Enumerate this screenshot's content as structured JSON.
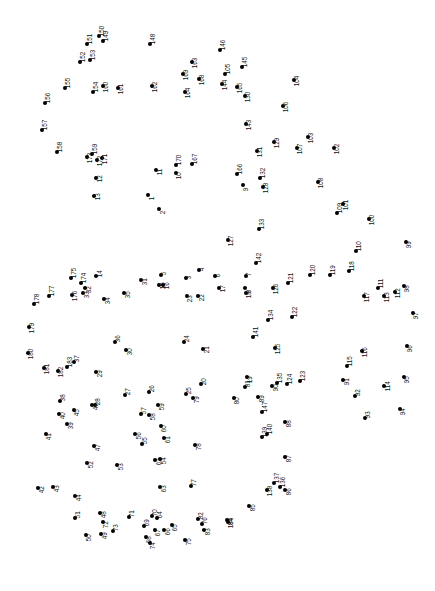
{
  "page": {
    "type": "connect-the-dots-puzzle",
    "width": 435,
    "height": 591,
    "background_color": "#ffffff",
    "dot_color": "#000000",
    "label_color": "#111111",
    "label_rotation_deg": -90,
    "dot_count": 184
  },
  "chart_data": {
    "type": "scatter",
    "xlabel": "",
    "ylabel": "",
    "xlim": [
      0,
      435
    ],
    "ylim": [
      0,
      591
    ],
    "grid": false,
    "legend": "none",
    "points": [
      {
        "n": "1",
        "x": 148,
        "y": 195,
        "lx": 4,
        "ly": 2
      },
      {
        "n": "2",
        "x": 159,
        "y": 209,
        "lx": 4,
        "ly": 2
      },
      {
        "n": "3",
        "x": 186,
        "y": 278,
        "lx": 3,
        "ly": -2
      },
      {
        "n": "4",
        "x": 199,
        "y": 270,
        "lx": 3,
        "ly": -2
      },
      {
        "n": "5",
        "x": 161,
        "y": 275,
        "lx": 3,
        "ly": -3
      },
      {
        "n": "6",
        "x": 215,
        "y": 276,
        "lx": 3,
        "ly": -2
      },
      {
        "n": "7",
        "x": 246,
        "y": 276,
        "lx": 3,
        "ly": -3
      },
      {
        "n": "8",
        "x": 245,
        "y": 288,
        "lx": 4,
        "ly": 2
      },
      {
        "n": "9",
        "x": 243,
        "y": 185,
        "lx": 3,
        "ly": 3
      },
      {
        "n": "10",
        "x": 176,
        "y": 173,
        "lx": 3,
        "ly": 3
      },
      {
        "n": "11",
        "x": 156,
        "y": 170,
        "lx": 4,
        "ly": 2
      },
      {
        "n": "12",
        "x": 96,
        "y": 178,
        "lx": 4,
        "ly": 1
      },
      {
        "n": "13",
        "x": 94,
        "y": 196,
        "lx": 4,
        "ly": 1
      },
      {
        "n": "14",
        "x": 96,
        "y": 276,
        "lx": 4,
        "ly": -2
      },
      {
        "n": "15",
        "x": 159,
        "y": 285,
        "lx": 4,
        "ly": 1
      },
      {
        "n": "16",
        "x": 163,
        "y": 285,
        "lx": 4,
        "ly": 1
      },
      {
        "n": "17",
        "x": 219,
        "y": 288,
        "lx": 4,
        "ly": 1
      },
      {
        "n": "18",
        "x": 246,
        "y": 293,
        "lx": 3,
        "ly": 2
      },
      {
        "n": "19",
        "x": 247,
        "y": 377,
        "lx": 3,
        "ly": 3
      },
      {
        "n": "20",
        "x": 201,
        "y": 384,
        "lx": 3,
        "ly": -2
      },
      {
        "n": "21",
        "x": 203,
        "y": 349,
        "lx": 4,
        "ly": 1
      },
      {
        "n": "22",
        "x": 198,
        "y": 296,
        "lx": 4,
        "ly": 2
      },
      {
        "n": "23",
        "x": 187,
        "y": 296,
        "lx": 3,
        "ly": 3
      },
      {
        "n": "24",
        "x": 184,
        "y": 342,
        "lx": 3,
        "ly": -3
      },
      {
        "n": "25",
        "x": 186,
        "y": 394,
        "lx": 3,
        "ly": -3
      },
      {
        "n": "26",
        "x": 149,
        "y": 392,
        "lx": 3,
        "ly": -3
      },
      {
        "n": "27",
        "x": 125,
        "y": 395,
        "lx": 3,
        "ly": -3
      },
      {
        "n": "28",
        "x": 95,
        "y": 405,
        "lx": 3,
        "ly": -3
      },
      {
        "n": "29",
        "x": 96,
        "y": 372,
        "lx": 4,
        "ly": 2
      },
      {
        "n": "30",
        "x": 126,
        "y": 350,
        "lx": 4,
        "ly": 2
      },
      {
        "n": "31",
        "x": 141,
        "y": 280,
        "lx": 4,
        "ly": 2
      },
      {
        "n": "32",
        "x": 85,
        "y": 288,
        "lx": 4,
        "ly": 2
      },
      {
        "n": "33",
        "x": 83,
        "y": 293,
        "lx": 4,
        "ly": 2
      },
      {
        "n": "34",
        "x": 104,
        "y": 299,
        "lx": 4,
        "ly": 2
      },
      {
        "n": "35",
        "x": 124,
        "y": 293,
        "lx": 4,
        "ly": 2
      },
      {
        "n": "36",
        "x": 115,
        "y": 342,
        "lx": 3,
        "ly": -3
      },
      {
        "n": "37",
        "x": 74,
        "y": 362,
        "lx": 3,
        "ly": -3
      },
      {
        "n": "38",
        "x": 60,
        "y": 401,
        "lx": 3,
        "ly": -3
      },
      {
        "n": "39",
        "x": 67,
        "y": 424,
        "lx": 4,
        "ly": 2
      },
      {
        "n": "40",
        "x": 59,
        "y": 414,
        "lx": 4,
        "ly": 2
      },
      {
        "n": "41",
        "x": 46,
        "y": 434,
        "lx": 3,
        "ly": 3
      },
      {
        "n": "42",
        "x": 38,
        "y": 488,
        "lx": 4,
        "ly": 2
      },
      {
        "n": "43",
        "x": 53,
        "y": 487,
        "lx": 4,
        "ly": 2
      },
      {
        "n": "44",
        "x": 75,
        "y": 496,
        "lx": 4,
        "ly": 2
      },
      {
        "n": "45",
        "x": 74,
        "y": 410,
        "lx": 3,
        "ly": 3
      },
      {
        "n": "46",
        "x": 92,
        "y": 405,
        "lx": 4,
        "ly": 2
      },
      {
        "n": "47",
        "x": 94,
        "y": 446,
        "lx": 4,
        "ly": 2
      },
      {
        "n": "48",
        "x": 100,
        "y": 513,
        "lx": 4,
        "ly": 2
      },
      {
        "n": "49",
        "x": 101,
        "y": 534,
        "lx": 4,
        "ly": 2
      },
      {
        "n": "50",
        "x": 86,
        "y": 535,
        "lx": 3,
        "ly": 3
      },
      {
        "n": "51",
        "x": 75,
        "y": 518,
        "lx": 3,
        "ly": -3
      },
      {
        "n": "52",
        "x": 87,
        "y": 463,
        "lx": 4,
        "ly": 2
      },
      {
        "n": "53",
        "x": 117,
        "y": 465,
        "lx": 4,
        "ly": 2
      },
      {
        "n": "54",
        "x": 160,
        "y": 459,
        "lx": 4,
        "ly": 2
      },
      {
        "n": "55",
        "x": 142,
        "y": 444,
        "lx": 3,
        "ly": -3
      },
      {
        "n": "56",
        "x": 135,
        "y": 434,
        "lx": 4,
        "ly": 2
      },
      {
        "n": "57",
        "x": 141,
        "y": 414,
        "lx": 3,
        "ly": -3
      },
      {
        "n": "58",
        "x": 149,
        "y": 415,
        "lx": 4,
        "ly": 2
      },
      {
        "n": "59",
        "x": 158,
        "y": 405,
        "lx": 4,
        "ly": 2
      },
      {
        "n": "60",
        "x": 161,
        "y": 426,
        "lx": 3,
        "ly": 3
      },
      {
        "n": "61",
        "x": 164,
        "y": 438,
        "lx": 4,
        "ly": 2
      },
      {
        "n": "62",
        "x": 155,
        "y": 460,
        "lx": 4,
        "ly": 2
      },
      {
        "n": "63",
        "x": 160,
        "y": 487,
        "lx": 4,
        "ly": 2
      },
      {
        "n": "64",
        "x": 157,
        "y": 518,
        "lx": 3,
        "ly": -3
      },
      {
        "n": "65",
        "x": 172,
        "y": 525,
        "lx": 3,
        "ly": 3
      },
      {
        "n": "66",
        "x": 164,
        "y": 530,
        "lx": 4,
        "ly": 2
      },
      {
        "n": "67",
        "x": 155,
        "y": 530,
        "lx": 3,
        "ly": 3
      },
      {
        "n": "68",
        "x": 146,
        "y": 537,
        "lx": 3,
        "ly": 3
      },
      {
        "n": "69",
        "x": 144,
        "y": 526,
        "lx": 3,
        "ly": -3
      },
      {
        "n": "70",
        "x": 152,
        "y": 516,
        "lx": 3,
        "ly": -3
      },
      {
        "n": "71",
        "x": 129,
        "y": 517,
        "lx": 3,
        "ly": -3
      },
      {
        "n": "72",
        "x": 103,
        "y": 522,
        "lx": 3,
        "ly": 3
      },
      {
        "n": "73",
        "x": 113,
        "y": 531,
        "lx": 3,
        "ly": -3
      },
      {
        "n": "74",
        "x": 150,
        "y": 543,
        "lx": 3,
        "ly": 3
      },
      {
        "n": "75",
        "x": 185,
        "y": 540,
        "lx": 4,
        "ly": 2
      },
      {
        "n": "76",
        "x": 202,
        "y": 524,
        "lx": 3,
        "ly": -3
      },
      {
        "n": "77",
        "x": 191,
        "y": 486,
        "lx": 3,
        "ly": -3
      },
      {
        "n": "78",
        "x": 195,
        "y": 445,
        "lx": 4,
        "ly": 2
      },
      {
        "n": "79",
        "x": 193,
        "y": 398,
        "lx": 4,
        "ly": 2
      },
      {
        "n": "80",
        "x": 234,
        "y": 398,
        "lx": 3,
        "ly": 3
      },
      {
        "n": "81",
        "x": 245,
        "y": 387,
        "lx": 3,
        "ly": -3
      },
      {
        "n": "82",
        "x": 198,
        "y": 519,
        "lx": 3,
        "ly": -3
      },
      {
        "n": "83",
        "x": 204,
        "y": 530,
        "lx": 4,
        "ly": 2
      },
      {
        "n": "84",
        "x": 227,
        "y": 520,
        "lx": 4,
        "ly": 2
      },
      {
        "n": "85",
        "x": 249,
        "y": 506,
        "lx": 4,
        "ly": 2
      },
      {
        "n": "86",
        "x": 285,
        "y": 490,
        "lx": 4,
        "ly": 2
      },
      {
        "n": "87",
        "x": 285,
        "y": 457,
        "lx": 4,
        "ly": 2
      },
      {
        "n": "88",
        "x": 285,
        "y": 422,
        "lx": 4,
        "ly": 2
      },
      {
        "n": "89",
        "x": 258,
        "y": 397,
        "lx": 4,
        "ly": 2
      },
      {
        "n": "90",
        "x": 272,
        "y": 386,
        "lx": 4,
        "ly": 2
      },
      {
        "n": "91",
        "x": 343,
        "y": 380,
        "lx": 4,
        "ly": 2
      },
      {
        "n": "92",
        "x": 355,
        "y": 396,
        "lx": 3,
        "ly": -3
      },
      {
        "n": "93",
        "x": 365,
        "y": 418,
        "lx": 3,
        "ly": -3
      },
      {
        "n": "94",
        "x": 400,
        "y": 409,
        "lx": 3,
        "ly": 3
      },
      {
        "n": "95",
        "x": 404,
        "y": 377,
        "lx": 3,
        "ly": 3
      },
      {
        "n": "96",
        "x": 407,
        "y": 346,
        "lx": 3,
        "ly": 3
      },
      {
        "n": "97",
        "x": 413,
        "y": 313,
        "lx": 3,
        "ly": 3
      },
      {
        "n": "98",
        "x": 404,
        "y": 286,
        "lx": 3,
        "ly": 3
      },
      {
        "n": "99",
        "x": 406,
        "y": 242,
        "lx": 3,
        "ly": 3
      },
      {
        "n": "100",
        "x": 369,
        "y": 219,
        "lx": 3,
        "ly": 3
      },
      {
        "n": "101",
        "x": 343,
        "y": 204,
        "lx": 3,
        "ly": 3
      },
      {
        "n": "102",
        "x": 334,
        "y": 148,
        "lx": 3,
        "ly": 3
      },
      {
        "n": "103",
        "x": 308,
        "y": 137,
        "lx": 3,
        "ly": 3
      },
      {
        "n": "104",
        "x": 294,
        "y": 80,
        "lx": 3,
        "ly": 3
      },
      {
        "n": "105",
        "x": 225,
        "y": 74,
        "lx": 3,
        "ly": -3
      },
      {
        "n": "106",
        "x": 283,
        "y": 106,
        "lx": 3,
        "ly": 3
      },
      {
        "n": "107",
        "x": 297,
        "y": 148,
        "lx": 3,
        "ly": 3
      },
      {
        "n": "108",
        "x": 318,
        "y": 182,
        "lx": 3,
        "ly": 3
      },
      {
        "n": "109",
        "x": 337,
        "y": 213,
        "lx": 3,
        "ly": -3
      },
      {
        "n": "110",
        "x": 356,
        "y": 251,
        "lx": 3,
        "ly": -3
      },
      {
        "n": "111",
        "x": 378,
        "y": 288,
        "lx": 3,
        "ly": -3
      },
      {
        "n": "112",
        "x": 395,
        "y": 292,
        "lx": 3,
        "ly": 3
      },
      {
        "n": "113",
        "x": 384,
        "y": 296,
        "lx": 3,
        "ly": 3
      },
      {
        "n": "114",
        "x": 384,
        "y": 386,
        "lx": 4,
        "ly": 2
      },
      {
        "n": "115",
        "x": 347,
        "y": 366,
        "lx": 3,
        "ly": -3
      },
      {
        "n": "116",
        "x": 362,
        "y": 351,
        "lx": 3,
        "ly": 3
      },
      {
        "n": "117",
        "x": 364,
        "y": 296,
        "lx": 3,
        "ly": 3
      },
      {
        "n": "118",
        "x": 349,
        "y": 271,
        "lx": 3,
        "ly": -3
      },
      {
        "n": "119",
        "x": 330,
        "y": 275,
        "lx": 3,
        "ly": -3
      },
      {
        "n": "120",
        "x": 310,
        "y": 275,
        "lx": 3,
        "ly": -3
      },
      {
        "n": "121",
        "x": 288,
        "y": 283,
        "lx": 3,
        "ly": -3
      },
      {
        "n": "122",
        "x": 292,
        "y": 317,
        "lx": 3,
        "ly": -3
      },
      {
        "n": "123",
        "x": 300,
        "y": 381,
        "lx": 3,
        "ly": -3
      },
      {
        "n": "124",
        "x": 287,
        "y": 384,
        "lx": 3,
        "ly": -3
      },
      {
        "n": "125",
        "x": 275,
        "y": 348,
        "lx": 3,
        "ly": 3
      },
      {
        "n": "126",
        "x": 273,
        "y": 288,
        "lx": 3,
        "ly": 3
      },
      {
        "n": "127",
        "x": 228,
        "y": 240,
        "lx": 3,
        "ly": 3
      },
      {
        "n": "128",
        "x": 263,
        "y": 187,
        "lx": 3,
        "ly": 3
      },
      {
        "n": "129",
        "x": 274,
        "y": 142,
        "lx": 3,
        "ly": 3
      },
      {
        "n": "130",
        "x": 245,
        "y": 96,
        "lx": 3,
        "ly": 3
      },
      {
        "n": "131",
        "x": 257,
        "y": 151,
        "lx": 3,
        "ly": 3
      },
      {
        "n": "132",
        "x": 260,
        "y": 178,
        "lx": 3,
        "ly": -3
      },
      {
        "n": "133",
        "x": 259,
        "y": 229,
        "lx": 3,
        "ly": -3
      },
      {
        "n": "134",
        "x": 268,
        "y": 320,
        "lx": 3,
        "ly": -3
      },
      {
        "n": "135",
        "x": 277,
        "y": 383,
        "lx": 3,
        "ly": -3
      },
      {
        "n": "136",
        "x": 280,
        "y": 487,
        "lx": 3,
        "ly": -3
      },
      {
        "n": "137",
        "x": 274,
        "y": 483,
        "lx": 3,
        "ly": -3
      },
      {
        "n": "138",
        "x": 267,
        "y": 490,
        "lx": 3,
        "ly": 3
      },
      {
        "n": "139",
        "x": 262,
        "y": 437,
        "lx": 3,
        "ly": -3
      },
      {
        "n": "140",
        "x": 267,
        "y": 434,
        "lx": 3,
        "ly": -3
      },
      {
        "n": "141",
        "x": 253,
        "y": 337,
        "lx": 3,
        "ly": -3
      },
      {
        "n": "142",
        "x": 256,
        "y": 263,
        "lx": 3,
        "ly": -3
      },
      {
        "n": "143",
        "x": 246,
        "y": 124,
        "lx": 3,
        "ly": 3
      },
      {
        "n": "144",
        "x": 222,
        "y": 84,
        "lx": 3,
        "ly": 3
      },
      {
        "n": "145",
        "x": 242,
        "y": 67,
        "lx": 3,
        "ly": -3
      },
      {
        "n": "146",
        "x": 220,
        "y": 50,
        "lx": 3,
        "ly": -3
      },
      {
        "n": "147",
        "x": 262,
        "y": 412,
        "lx": 3,
        "ly": -3
      },
      {
        "n": "148",
        "x": 150,
        "y": 44,
        "lx": 3,
        "ly": -3
      },
      {
        "n": "149",
        "x": 103,
        "y": 41,
        "lx": 3,
        "ly": -3
      },
      {
        "n": "150",
        "x": 99,
        "y": 36,
        "lx": 3,
        "ly": -3
      },
      {
        "n": "151",
        "x": 87,
        "y": 44,
        "lx": 3,
        "ly": -3
      },
      {
        "n": "152",
        "x": 80,
        "y": 62,
        "lx": 3,
        "ly": -3
      },
      {
        "n": "153",
        "x": 90,
        "y": 60,
        "lx": 3,
        "ly": -3
      },
      {
        "n": "154",
        "x": 93,
        "y": 92,
        "lx": 3,
        "ly": -3
      },
      {
        "n": "155",
        "x": 65,
        "y": 88,
        "lx": 3,
        "ly": -3
      },
      {
        "n": "156",
        "x": 45,
        "y": 103,
        "lx": 3,
        "ly": -3
      },
      {
        "n": "157",
        "x": 42,
        "y": 130,
        "lx": 3,
        "ly": -3
      },
      {
        "n": "158",
        "x": 57,
        "y": 152,
        "lx": 3,
        "ly": -3
      },
      {
        "n": "159",
        "x": 92,
        "y": 154,
        "lx": 3,
        "ly": -3
      },
      {
        "n": "160",
        "x": 103,
        "y": 86,
        "lx": 3,
        "ly": 3
      },
      {
        "n": "161",
        "x": 118,
        "y": 88,
        "lx": 3,
        "ly": 3
      },
      {
        "n": "162",
        "x": 152,
        "y": 86,
        "lx": 3,
        "ly": 3
      },
      {
        "n": "163",
        "x": 192,
        "y": 62,
        "lx": 3,
        "ly": 3
      },
      {
        "n": "164",
        "x": 185,
        "y": 92,
        "lx": 3,
        "ly": 3
      },
      {
        "n": "165",
        "x": 237,
        "y": 87,
        "lx": 3,
        "ly": 3
      },
      {
        "n": "166",
        "x": 237,
        "y": 174,
        "lx": 3,
        "ly": -3
      },
      {
        "n": "167",
        "x": 192,
        "y": 164,
        "lx": 3,
        "ly": -3
      },
      {
        "n": "168",
        "x": 199,
        "y": 79,
        "lx": 3,
        "ly": 3
      },
      {
        "n": "169",
        "x": 183,
        "y": 74,
        "lx": 3,
        "ly": 3
      },
      {
        "n": "170",
        "x": 176,
        "y": 165,
        "lx": 3,
        "ly": -3
      },
      {
        "n": "171",
        "x": 102,
        "y": 158,
        "lx": 3,
        "ly": 3
      },
      {
        "n": "172",
        "x": 97,
        "y": 160,
        "lx": 3,
        "ly": 3
      },
      {
        "n": "173",
        "x": 87,
        "y": 157,
        "lx": 3,
        "ly": 3
      },
      {
        "n": "174",
        "x": 81,
        "y": 283,
        "lx": 3,
        "ly": -3
      },
      {
        "n": "175",
        "x": 71,
        "y": 278,
        "lx": 3,
        "ly": -3
      },
      {
        "n": "176",
        "x": 72,
        "y": 295,
        "lx": 3,
        "ly": 3
      },
      {
        "n": "177",
        "x": 49,
        "y": 296,
        "lx": 3,
        "ly": -3
      },
      {
        "n": "178",
        "x": 34,
        "y": 304,
        "lx": 3,
        "ly": -3
      },
      {
        "n": "179",
        "x": 29,
        "y": 327,
        "lx": 3,
        "ly": 3
      },
      {
        "n": "180",
        "x": 28,
        "y": 353,
        "lx": 3,
        "ly": 3
      },
      {
        "n": "181",
        "x": 44,
        "y": 368,
        "lx": 3,
        "ly": 3
      },
      {
        "n": "182",
        "x": 58,
        "y": 371,
        "lx": 3,
        "ly": 3
      },
      {
        "n": "183",
        "x": 67,
        "y": 367,
        "lx": 3,
        "ly": -3
      },
      {
        "n": "184",
        "x": 228,
        "y": 522,
        "lx": 3,
        "ly": 3
      }
    ]
  }
}
